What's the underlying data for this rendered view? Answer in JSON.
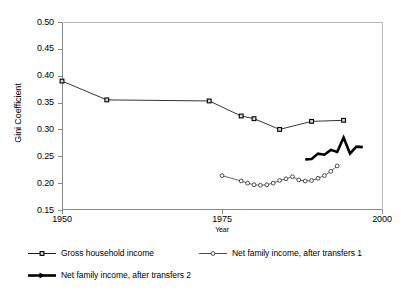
{
  "chart_data": {
    "type": "line",
    "title": "",
    "xlabel": "Year",
    "ylabel": "Gini Coefficient",
    "xlim": [
      1950,
      2000
    ],
    "ylim": [
      0.15,
      0.5
    ],
    "xticks": [
      1950,
      1975,
      2000
    ],
    "xtick_labels": [
      "1950",
      "1975",
      "2000"
    ],
    "yticks": [
      0.15,
      0.2,
      0.25,
      0.3,
      0.35,
      0.4,
      0.45,
      0.5
    ],
    "ytick_labels": [
      "0.15",
      "0.20",
      "0.25",
      "0.30",
      "0.35",
      "0.40",
      "0.45",
      "0.50"
    ],
    "grid": false,
    "legend_position": "below",
    "series": [
      {
        "name": "Gross household income",
        "marker": "filled-square",
        "color": "#000000",
        "linewidth": 0.8,
        "x": [
          1950,
          1957,
          1973,
          1978,
          1980,
          1984,
          1989,
          1994
        ],
        "y": [
          0.39,
          0.355,
          0.353,
          0.325,
          0.32,
          0.3,
          0.315,
          0.317
        ]
      },
      {
        "name": "Net family income, after transfers 1",
        "marker": "open-circle",
        "color": "#3a3a3a",
        "linewidth": 0.8,
        "x": [
          1975,
          1978,
          1979,
          1980,
          1981,
          1982,
          1983,
          1984,
          1985,
          1986,
          1987,
          1988,
          1989,
          1990,
          1991,
          1992,
          1993
        ],
        "y": [
          0.214,
          0.204,
          0.2,
          0.197,
          0.196,
          0.197,
          0.2,
          0.205,
          0.208,
          0.212,
          0.206,
          0.204,
          0.205,
          0.209,
          0.214,
          0.222,
          0.232
        ]
      },
      {
        "name": "Net family income, after transfers 2",
        "marker": "none",
        "color": "#000000",
        "linewidth": 2.6,
        "x": [
          1988,
          1989,
          1990,
          1991,
          1992,
          1993,
          1994,
          1995,
          1996,
          1997
        ],
        "y": [
          0.244,
          0.245,
          0.255,
          0.253,
          0.262,
          0.258,
          0.285,
          0.255,
          0.268,
          0.267
        ]
      }
    ]
  },
  "legend": {
    "entries": [
      {
        "label": "Gross household income",
        "marker": "filled-square",
        "color": "#000000"
      },
      {
        "label": "Net family income, after transfers 1",
        "marker": "open-circle",
        "color": "#3a3a3a"
      },
      {
        "label": "Net family income, after transfers 2",
        "marker": "none",
        "color": "#000000"
      }
    ]
  }
}
